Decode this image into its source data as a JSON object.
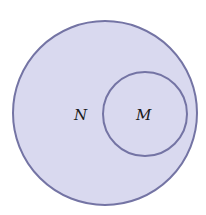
{
  "diagram": {
    "type": "venn",
    "outer_set": {
      "label": "N",
      "fill": "#d9d9ef",
      "stroke": "#7474a4"
    },
    "inner_set": {
      "label": "M",
      "fill": "#d9d9ef",
      "stroke": "#7474a4"
    },
    "relation": "M is a subset of N"
  }
}
